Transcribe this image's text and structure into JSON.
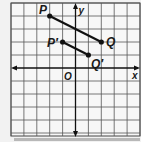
{
  "diagram": {
    "type": "coordinate-grid",
    "labels": {
      "origin": "O",
      "x_axis": "x",
      "y_axis": "y"
    },
    "grid": {
      "x_min": -5,
      "x_max": 5,
      "y_min": -5,
      "y_max": 5,
      "origin_px": [
        75.5,
        68
      ],
      "unit_px_x": 12.9,
      "unit_px_y": 13
    },
    "points": [
      {
        "id": "P",
        "label": "P",
        "coord": [
          -2,
          4
        ]
      },
      {
        "id": "Q",
        "label": "Q",
        "coord": [
          2,
          2
        ]
      },
      {
        "id": "P2",
        "label": "P′",
        "coord": [
          -1,
          2
        ]
      },
      {
        "id": "Q2",
        "label": "Q′",
        "coord": [
          1,
          1
        ]
      }
    ],
    "segments": [
      {
        "from": "P",
        "to": "Q",
        "name": "PQ"
      },
      {
        "from": "P2",
        "to": "Q2",
        "name": "P′Q′"
      }
    ],
    "colors": {
      "background": "#f2f2f2",
      "grid_fill": "#f6f6f6",
      "grid_line": "#444444",
      "axis": "#111111",
      "segment": "#111111",
      "shadow": "#b0b0b0"
    }
  }
}
